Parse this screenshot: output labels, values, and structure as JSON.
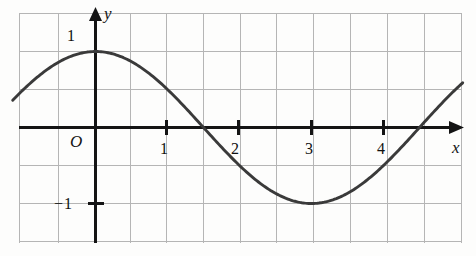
{
  "figure": {
    "kind": "cartesian-plot",
    "background_color": "#fdfdfc",
    "grid_color": "#b5b5b5",
    "axis_color": "#141414",
    "curve_color": "#3a3a3a"
  },
  "axes": {
    "x_axis_label": "x",
    "y_axis_label": "y",
    "origin_label": "O",
    "x_tick_labels": [
      "1",
      "2",
      "3",
      "4"
    ],
    "x_tick_values": [
      1,
      2,
      3,
      4
    ],
    "y_tick_labels": [
      "1",
      "−1"
    ],
    "y_tick_values": [
      1,
      -1
    ]
  },
  "chart_data": {
    "type": "line",
    "title": "",
    "xlabel": "x",
    "ylabel": "y",
    "xlim": [
      -1.18,
      5.2
    ],
    "ylim": [
      -1.55,
      1.55
    ],
    "grid": true,
    "legend": null,
    "x_ticks": [
      1,
      2,
      3,
      4
    ],
    "y_ticks": [
      1,
      -1
    ],
    "gridline_spacing_x_units": 0.5,
    "gridline_spacing_y_units": 0.5,
    "series": [
      {
        "name": "y = cos(πx/3)",
        "equation": "y = cos(pi*x/3)",
        "amplitude": 1,
        "period": 6,
        "phase": 0,
        "x": [
          -1.15,
          -1.0,
          -0.75,
          -0.5,
          -0.25,
          0,
          0.25,
          0.5,
          0.75,
          1.0,
          1.25,
          1.5,
          1.75,
          2.0,
          2.25,
          2.5,
          2.75,
          3.0,
          3.25,
          3.5,
          3.75,
          4.0,
          4.25,
          4.5,
          4.75,
          5.0,
          5.1
        ],
        "values": [
          0.42,
          0.5,
          0.707,
          0.866,
          0.966,
          1.0,
          0.966,
          0.866,
          0.707,
          0.5,
          0.259,
          0.0,
          -0.259,
          -0.5,
          -0.707,
          -0.866,
          -0.966,
          -1.0,
          -0.966,
          -0.866,
          -0.707,
          -0.5,
          -0.259,
          0.0,
          0.259,
          0.5,
          0.588
        ]
      }
    ],
    "annotations": {
      "maximum": {
        "x": 0,
        "y": 1
      },
      "minimum": {
        "x": 3,
        "y": -1
      },
      "zero_crossings": [
        1.5,
        4.5
      ]
    }
  }
}
